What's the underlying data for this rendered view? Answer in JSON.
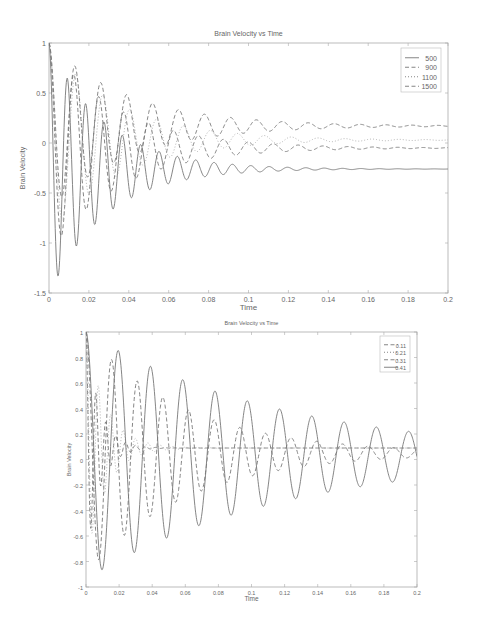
{
  "chart_data": [
    {
      "type": "line",
      "title": "Brain Velocity vs Time",
      "xlabel": "Time",
      "ylabel": "Brain Velocity",
      "xlim": [
        0,
        0.2
      ],
      "ylim": [
        -1.5,
        1
      ],
      "xticks": [
        "0",
        "0.02",
        "0.04",
        "0.06",
        "0.08",
        "0.1",
        "0.12",
        "0.14",
        "0.16",
        "0.18",
        "0.2"
      ],
      "yticks": [
        "1",
        "0.5",
        "0",
        "-0.5",
        "-1",
        "-1.5"
      ],
      "grid": false,
      "legend_position": "upper right",
      "series": [
        {
          "name": "500",
          "style": "solid",
          "steady_value": -0.26,
          "first_min": -1.35,
          "period": 0.0092,
          "decay": 0.028
        },
        {
          "name": "900",
          "style": "dashed",
          "steady_value": -0.05,
          "first_min": -0.88,
          "period": 0.0125,
          "decay": 0.035
        },
        {
          "name": "1100",
          "style": "dotted",
          "steady_value": 0.03,
          "first_min": -0.75,
          "period": 0.0135,
          "decay": 0.035
        },
        {
          "name": "1500",
          "style": "dashed",
          "steady_value": 0.17,
          "first_min": -0.6,
          "period": 0.013,
          "decay": 0.04
        }
      ],
      "annotations": []
    },
    {
      "type": "line",
      "title": "Brain Velocity vs Time",
      "xlabel": "Time",
      "ylabel": "Brain Velocity",
      "xlim": [
        0,
        0.2
      ],
      "ylim": [
        -1,
        1
      ],
      "xticks": [
        "0",
        "0.02",
        "0.04",
        "0.06",
        "0.08",
        "0.1",
        "0.12",
        "0.14",
        "0.16",
        "0.18",
        "0.2"
      ],
      "yticks": [
        "1",
        "0.8",
        "0.6",
        "0.4",
        "0.2",
        "0",
        "-0.2",
        "-0.4",
        "-0.6",
        "-0.8",
        "-1"
      ],
      "grid": false,
      "legend_position": "upper right",
      "series": [
        {
          "name": "0.11",
          "style": "dashed",
          "steady_value": 0.09,
          "period": 0.006,
          "decay": 0.008
        },
        {
          "name": "0.21",
          "style": "dotted",
          "steady_value": 0.09,
          "period": 0.0075,
          "decay": 0.012
        },
        {
          "name": "0.31",
          "style": "dashed",
          "steady_value": 0.05,
          "period": 0.0155,
          "decay": 0.06
        },
        {
          "name": "0.41",
          "style": "solid",
          "steady_value": 0.03,
          "period": 0.0195,
          "decay": 0.12
        }
      ]
    }
  ]
}
